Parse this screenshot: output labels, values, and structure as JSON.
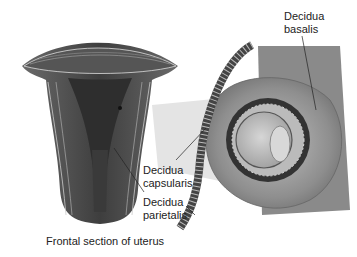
{
  "diagram": {
    "labels": {
      "basalis": "Decidua\nbasalis",
      "capsularis": "Decidua\ncapsularis",
      "parietalis": "Decidua\nparietalis",
      "caption": "Frontal section of uterus"
    },
    "colors": {
      "muscle_dark": "#4a4a4a",
      "muscle_mid": "#7a7a7a",
      "muscle_light": "#bdbdbd",
      "tissue": "#9a9a9a",
      "zoom_beam": "#e2e2e2",
      "text": "#222222"
    }
  }
}
